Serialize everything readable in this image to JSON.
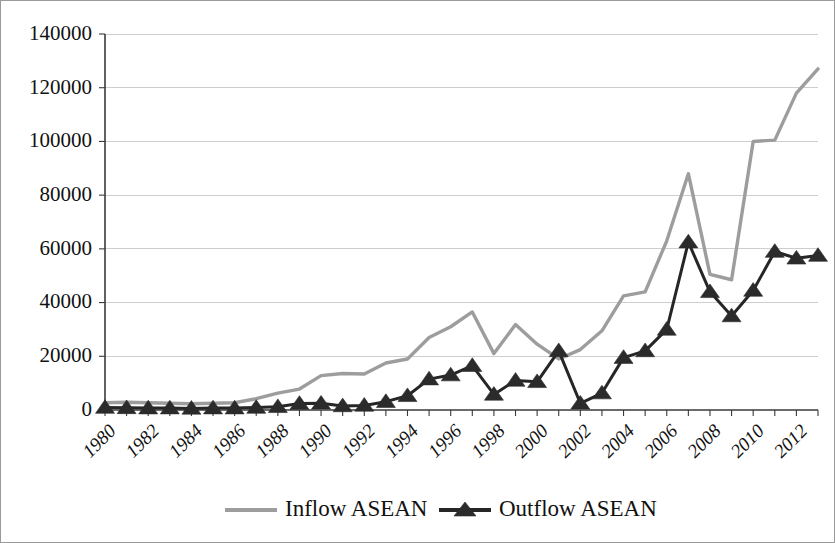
{
  "chart_data": {
    "type": "line",
    "title": "",
    "subtitle": "",
    "xlabel": "",
    "ylabel": "",
    "grid": true,
    "legend_position": "bottom",
    "ylim": [
      0,
      140000
    ],
    "ytick_step": 20000,
    "ytick_labels": [
      "0",
      "20000",
      "40000",
      "60000",
      "80000",
      "100000",
      "120000",
      "140000"
    ],
    "ytick_values": [
      0,
      20000,
      40000,
      60000,
      80000,
      100000,
      120000,
      140000
    ],
    "x": [
      1980,
      1981,
      1982,
      1983,
      1984,
      1985,
      1986,
      1987,
      1988,
      1989,
      1990,
      1991,
      1992,
      1993,
      1994,
      1995,
      1996,
      1997,
      1998,
      1999,
      2000,
      2001,
      2002,
      2003,
      2004,
      2005,
      2006,
      2007,
      2008,
      2009,
      2010,
      2011,
      2012,
      2013
    ],
    "xtick_labels": [
      "1980",
      "1982",
      "1984",
      "1986",
      "1988",
      "1990",
      "1992",
      "1994",
      "1996",
      "1998",
      "2000",
      "2002",
      "2004",
      "2006",
      "2008",
      "2010",
      "2012"
    ],
    "xtick_values": [
      1980,
      1982,
      1984,
      1986,
      1988,
      1990,
      1992,
      1994,
      1996,
      1998,
      2000,
      2002,
      2004,
      2006,
      2008,
      2010,
      2012
    ],
    "xtick_rotation": 45,
    "series": [
      {
        "name": "Inflow ASEAN",
        "color": "#9d9d9d",
        "marker": "none",
        "values": [
          2700,
          2900,
          2700,
          2500,
          2300,
          2500,
          2700,
          4200,
          6300,
          7800,
          12800,
          13600,
          13400,
          17500,
          19000,
          27000,
          31000,
          36500,
          21000,
          31800,
          24500,
          19000,
          22500,
          29500,
          42500,
          44000,
          63000,
          88000,
          50500,
          48500,
          100000,
          100500,
          118000,
          127000
        ]
      },
      {
        "name": "Outflow ASEAN",
        "color": "#262626",
        "marker": "triangle",
        "values": [
          900,
          800,
          700,
          700,
          600,
          700,
          700,
          900,
          1200,
          2400,
          2500,
          1500,
          1700,
          3100,
          5300,
          11500,
          13000,
          16500,
          5800,
          11000,
          10500,
          22000,
          2500,
          6300,
          19500,
          22000,
          30000,
          62500,
          44000,
          35000,
          44500,
          59000,
          56500,
          57500
        ]
      }
    ]
  },
  "legend": {
    "items": [
      {
        "label": "Inflow ASEAN",
        "color": "#9d9d9d",
        "marker": "none"
      },
      {
        "label": "Outflow ASEAN",
        "color": "#262626",
        "marker": "triangle"
      }
    ]
  }
}
